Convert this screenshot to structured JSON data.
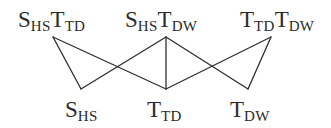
{
  "diagram": {
    "type": "hasse-diagram",
    "stroke_color": "#2e2e2e",
    "text_color": "#2b2b2b",
    "top_nodes": [
      {
        "id": "SHS_TTD",
        "parts": [
          {
            "main": "S",
            "sub": "HS"
          },
          {
            "main": "T",
            "sub": "TD"
          }
        ],
        "x": 53,
        "y": 37
      },
      {
        "id": "SHS_TDW",
        "parts": [
          {
            "main": "S",
            "sub": "HS"
          },
          {
            "main": "T",
            "sub": "DW"
          }
        ],
        "x": 166,
        "y": 37
      },
      {
        "id": "TTD_TDW",
        "parts": [
          {
            "main": "T",
            "sub": "TD"
          },
          {
            "main": "T",
            "sub": "DW"
          }
        ],
        "x": 271,
        "y": 37
      }
    ],
    "bottom_nodes": [
      {
        "id": "SHS",
        "parts": [
          {
            "main": "S",
            "sub": "HS"
          }
        ],
        "x": 81,
        "y": 89
      },
      {
        "id": "TTD",
        "parts": [
          {
            "main": "T",
            "sub": "TD"
          }
        ],
        "x": 166,
        "y": 89
      },
      {
        "id": "TDW",
        "parts": [
          {
            "main": "T",
            "sub": "DW"
          }
        ],
        "x": 248,
        "y": 89
      }
    ],
    "edges": [
      {
        "from": "SHS_TTD",
        "to": "SHS"
      },
      {
        "from": "SHS_TTD",
        "to": "TTD"
      },
      {
        "from": "SHS_TDW",
        "to": "SHS"
      },
      {
        "from": "SHS_TDW",
        "to": "TTD"
      },
      {
        "from": "SHS_TDW",
        "to": "TDW"
      },
      {
        "from": "TTD_TDW",
        "to": "TTD"
      },
      {
        "from": "TTD_TDW",
        "to": "TDW"
      }
    ]
  },
  "labels": {
    "top_left": {
      "p1_main": "S",
      "p1_sub": "HS",
      "p2_main": "T",
      "p2_sub": "TD"
    },
    "top_center": {
      "p1_main": "S",
      "p1_sub": "HS",
      "p2_main": "T",
      "p2_sub": "DW"
    },
    "top_right": {
      "p1_main": "T",
      "p1_sub": "TD",
      "p2_main": "T",
      "p2_sub": "DW"
    },
    "bottom_left": {
      "p1_main": "S",
      "p1_sub": "HS"
    },
    "bottom_center": {
      "p1_main": "T",
      "p1_sub": "TD"
    },
    "bottom_right": {
      "p1_main": "T",
      "p1_sub": "DW"
    }
  }
}
